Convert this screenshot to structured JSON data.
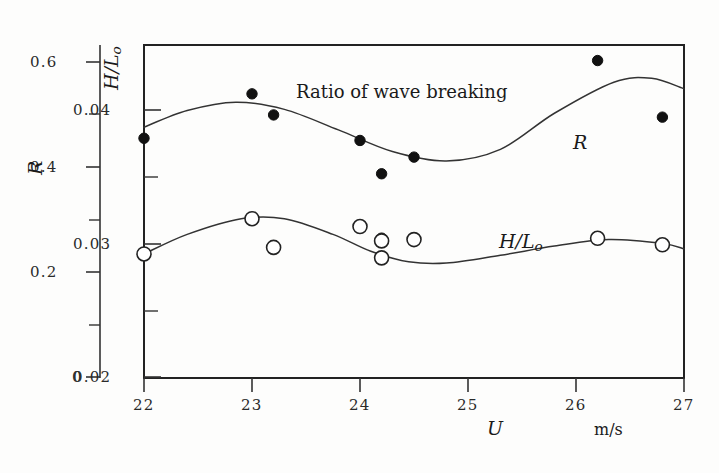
{
  "chart_data": {
    "type": "scatter",
    "title": "",
    "annotation": "Ratio of wave breaking",
    "xlabel": "U",
    "xunits": "m/s",
    "xlim": [
      22,
      27
    ],
    "xticks": [
      22,
      23,
      24,
      25,
      26,
      27
    ],
    "xtick_labels": [
      "22",
      "23",
      "24",
      "25",
      "26",
      "27"
    ],
    "grid": false,
    "legend_position": "inline-annotations",
    "axes": [
      {
        "name": "R",
        "label": "R",
        "position": "left-outer",
        "lim": [
          0,
          0.6
        ],
        "ticks": [
          0,
          0.2,
          0.4,
          0.6
        ],
        "tick_labels": [
          "0",
          "0.2",
          "0.4",
          "0.6"
        ],
        "minor_ticks": [
          0.1,
          0.3,
          0.5
        ]
      },
      {
        "name": "H/Lo",
        "label": "H/L_o",
        "position": "left-inner",
        "lim": [
          0.02,
          0.0455
        ],
        "ticks": [
          0.02,
          0.03,
          0.04
        ],
        "tick_labels": [
          "0.02",
          "0.03",
          "0.04"
        ],
        "minor_ticks": [
          0.025,
          0.035,
          0.045
        ]
      }
    ],
    "series": [
      {
        "name": "R",
        "label": "R",
        "marker": "filled-circle",
        "axis": "R",
        "points": [
          {
            "x": 22.0,
            "y": 0.432
          },
          {
            "x": 23.0,
            "y": 0.512
          },
          {
            "x": 23.2,
            "y": 0.474
          },
          {
            "x": 24.0,
            "y": 0.428
          },
          {
            "x": 24.2,
            "y": 0.368
          },
          {
            "x": 24.2,
            "y": 0.252
          },
          {
            "x": 24.5,
            "y": 0.398
          },
          {
            "x": 26.2,
            "y": 0.572
          },
          {
            "x": 26.8,
            "y": 0.47
          }
        ],
        "fit_curve": [
          {
            "x": 22.0,
            "y": 0.452
          },
          {
            "x": 22.4,
            "y": 0.482
          },
          {
            "x": 22.85,
            "y": 0.497
          },
          {
            "x": 23.3,
            "y": 0.484
          },
          {
            "x": 23.8,
            "y": 0.447
          },
          {
            "x": 24.3,
            "y": 0.408
          },
          {
            "x": 24.8,
            "y": 0.391
          },
          {
            "x": 25.3,
            "y": 0.412
          },
          {
            "x": 25.8,
            "y": 0.477
          },
          {
            "x": 26.35,
            "y": 0.533
          },
          {
            "x": 26.7,
            "y": 0.54
          },
          {
            "x": 27.0,
            "y": 0.521
          }
        ]
      },
      {
        "name": "H/Lo",
        "label": "H/L_o",
        "marker": "open-circle",
        "axis": "H/Lo",
        "points": [
          {
            "x": 22.0,
            "y": 0.0295
          },
          {
            "x": 23.0,
            "y": 0.0322
          },
          {
            "x": 23.2,
            "y": 0.03
          },
          {
            "x": 24.0,
            "y": 0.0316
          },
          {
            "x": 24.2,
            "y": 0.0305
          },
          {
            "x": 24.2,
            "y": 0.0292
          },
          {
            "x": 24.5,
            "y": 0.0306
          },
          {
            "x": 26.2,
            "y": 0.0307
          },
          {
            "x": 26.8,
            "y": 0.0302
          }
        ],
        "fit_curve": [
          {
            "x": 22.0,
            "y": 0.0295
          },
          {
            "x": 22.4,
            "y": 0.031
          },
          {
            "x": 22.9,
            "y": 0.0322
          },
          {
            "x": 23.3,
            "y": 0.0322
          },
          {
            "x": 23.75,
            "y": 0.031
          },
          {
            "x": 24.1,
            "y": 0.0297
          },
          {
            "x": 24.45,
            "y": 0.0289
          },
          {
            "x": 24.8,
            "y": 0.0288
          },
          {
            "x": 25.3,
            "y": 0.0294
          },
          {
            "x": 25.8,
            "y": 0.0301
          },
          {
            "x": 26.3,
            "y": 0.0306
          },
          {
            "x": 26.8,
            "y": 0.0303
          },
          {
            "x": 27.0,
            "y": 0.0299
          }
        ]
      }
    ]
  },
  "labels": {
    "r_axis_title": "R",
    "hlo_axis_title_num": "H",
    "hlo_axis_title_slash": "/",
    "hlo_axis_title_den": "L",
    "hlo_axis_title_sub": "o",
    "x_axis_title": "U",
    "x_axis_units": "m/s",
    "annotation_ratio": "Ratio of wave breaking",
    "annotation_r": "R",
    "annotation_hlo_num": "H",
    "annotation_hlo_slash": "/",
    "annotation_hlo_den": "L",
    "annotation_hlo_sub": "o"
  },
  "r_ticks": {
    "t0": "0",
    "t1": "0.2",
    "t2": "0.4",
    "t3": "0.6"
  },
  "hlo_ticks": {
    "t0": "0.02",
    "t1": "0.03",
    "t2": "0.04"
  },
  "x_ticks": {
    "t0": "22",
    "t1": "23",
    "t2": "24",
    "t3": "25",
    "t4": "26",
    "t5": "27"
  },
  "colors": {
    "ink": "#1a1a1a",
    "curve": "#333333",
    "marker_fill": "#111111",
    "marker_open": "#ffffff",
    "background": "#fdfdfc"
  }
}
